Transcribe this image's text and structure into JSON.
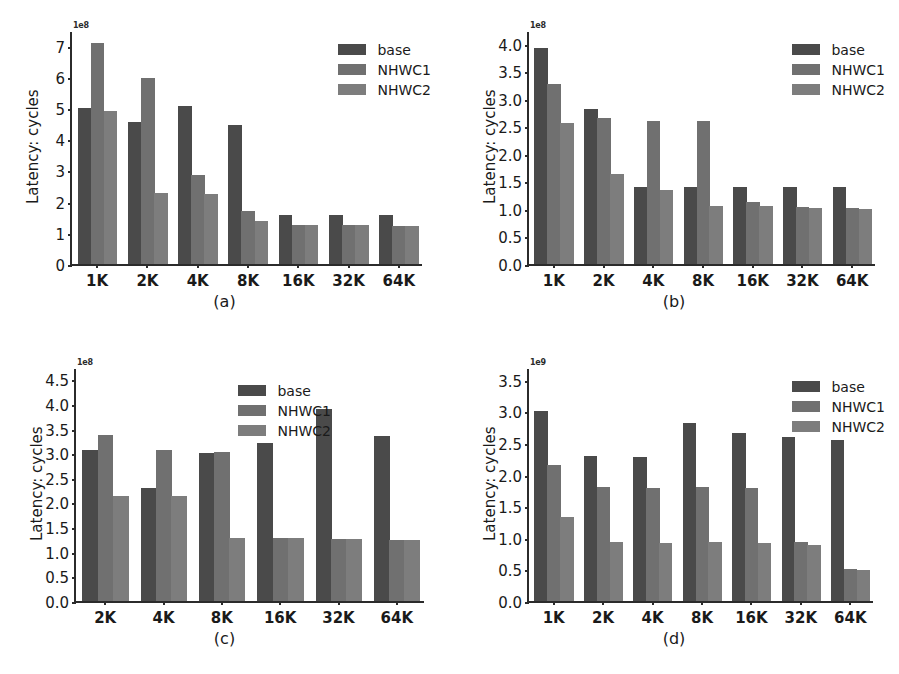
{
  "figure": {
    "background": "#ffffff",
    "series_colors": {
      "base": "#4a4a4a",
      "NHWC1": "#707070",
      "NHWC2": "#7d7d7d"
    },
    "legend_labels": [
      "base",
      "NHWC1",
      "NHWC2"
    ]
  },
  "chart_data": [
    {
      "id": "a",
      "type": "bar",
      "title": "",
      "caption": "(a)",
      "xlabel": "",
      "ylabel": "Latency: cycles",
      "exponent_label": "1e8",
      "exponent_value": 100000000,
      "ylim": [
        0,
        7.5
      ],
      "yticks": [
        "0",
        "1",
        "2",
        "3",
        "4",
        "5",
        "6",
        "7"
      ],
      "ytick_values": [
        0,
        1,
        2,
        3,
        4,
        5,
        6,
        7
      ],
      "grid": false,
      "legend_position": "upper right",
      "categories": [
        "1K",
        "2K",
        "4K",
        "8K",
        "16K",
        "32K",
        "64K"
      ],
      "series": [
        {
          "name": "base",
          "values": [
            5.0,
            4.55,
            5.07,
            4.47,
            1.58,
            1.58,
            1.58
          ]
        },
        {
          "name": "NHWC1",
          "values": [
            7.08,
            5.95,
            2.85,
            1.69,
            1.26,
            1.26,
            1.22
          ]
        },
        {
          "name": "NHWC2",
          "values": [
            4.92,
            2.27,
            2.25,
            1.37,
            1.26,
            1.26,
            1.22
          ]
        }
      ]
    },
    {
      "id": "b",
      "type": "bar",
      "title": "",
      "caption": "(b)",
      "xlabel": "",
      "ylabel": "Latency: cycles",
      "exponent_label": "1e8",
      "exponent_value": 100000000,
      "ylim": [
        0,
        4.25
      ],
      "yticks": [
        "0.0",
        "0.5",
        "1.0",
        "1.5",
        "2.0",
        "2.5",
        "3.0",
        "3.5",
        "4.0"
      ],
      "ytick_values": [
        0,
        0.5,
        1.0,
        1.5,
        2.0,
        2.5,
        3.0,
        3.5,
        4.0
      ],
      "grid": false,
      "legend_position": "upper right",
      "categories": [
        "1K",
        "2K",
        "4K",
        "8K",
        "16K",
        "32K",
        "64K"
      ],
      "series": [
        {
          "name": "base",
          "values": [
            3.93,
            2.82,
            1.39,
            1.39,
            1.39,
            1.39,
            1.39
          ]
        },
        {
          "name": "NHWC1",
          "values": [
            3.27,
            2.66,
            2.59,
            2.6,
            1.12,
            1.04,
            1.01
          ]
        },
        {
          "name": "NHWC2",
          "values": [
            2.57,
            1.64,
            1.34,
            1.06,
            1.06,
            1.01,
            1.0
          ]
        }
      ]
    },
    {
      "id": "c",
      "type": "bar",
      "title": "",
      "caption": "(c)",
      "xlabel": "",
      "ylabel": "Latency: cycles",
      "exponent_label": "1e8",
      "exponent_value": 100000000,
      "ylim": [
        0,
        4.75
      ],
      "yticks": [
        "0.0",
        "0.5",
        "1.0",
        "1.5",
        "2.0",
        "2.5",
        "3.0",
        "3.5",
        "4.0",
        "4.5"
      ],
      "ytick_values": [
        0,
        0.5,
        1.0,
        1.5,
        2.0,
        2.5,
        3.0,
        3.5,
        4.0,
        4.5
      ],
      "grid": false,
      "legend_position": "upper center",
      "categories": [
        "2K",
        "4K",
        "8K",
        "16K",
        "32K",
        "64K"
      ],
      "series": [
        {
          "name": "base",
          "values": [
            3.06,
            2.3,
            3.01,
            3.21,
            3.9,
            3.35
          ]
        },
        {
          "name": "NHWC1",
          "values": [
            3.37,
            3.07,
            3.03,
            1.28,
            1.26,
            1.24
          ]
        },
        {
          "name": "NHWC2",
          "values": [
            2.13,
            2.14,
            1.28,
            1.28,
            1.26,
            1.24
          ]
        }
      ]
    },
    {
      "id": "d",
      "type": "bar",
      "title": "",
      "caption": "(d)",
      "xlabel": "",
      "ylabel": "Latency: cycles",
      "exponent_label": "1e9",
      "exponent_value": 1000000000,
      "ylim": [
        0,
        3.7
      ],
      "yticks": [
        "0.0",
        "0.5",
        "1.0",
        "1.5",
        "2.0",
        "2.5",
        "3.0",
        "3.5"
      ],
      "ytick_values": [
        0,
        0.5,
        1.0,
        1.5,
        2.0,
        2.5,
        3.0,
        3.5
      ],
      "grid": false,
      "legend_position": "upper right",
      "categories": [
        "1K",
        "2K",
        "4K",
        "8K",
        "16K",
        "32K",
        "64K"
      ],
      "series": [
        {
          "name": "base",
          "values": [
            3.01,
            2.29,
            2.27,
            2.82,
            2.66,
            2.59,
            2.54
          ]
        },
        {
          "name": "NHWC1",
          "values": [
            2.15,
            1.8,
            1.78,
            1.8,
            1.78,
            0.94,
            0.5
          ]
        },
        {
          "name": "NHWC2",
          "values": [
            1.33,
            0.93,
            0.92,
            0.93,
            0.91,
            0.89,
            0.49
          ]
        }
      ]
    }
  ]
}
